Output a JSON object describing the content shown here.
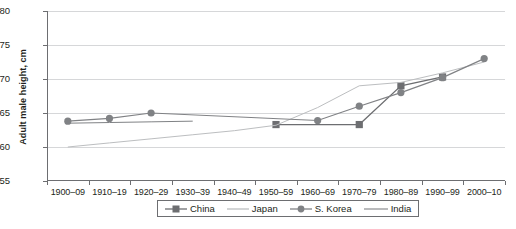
{
  "chart_data": {
    "type": "line",
    "title": "",
    "xlabel": "",
    "ylabel": "Adult male height, cm",
    "ylim": [
      155,
      180
    ],
    "yticks": [
      155,
      160,
      165,
      170,
      175,
      180
    ],
    "grid": true,
    "legend_position": "bottom",
    "categories": [
      "1900–09",
      "1910–19",
      "1920–29",
      "1930–39",
      "1940–49",
      "1950–59",
      "1960–69",
      "1970–79",
      "1980–89",
      "1990–99",
      "2000–10"
    ],
    "series": [
      {
        "name": "China",
        "color": "#6d6e71",
        "marker": "square",
        "values": [
          null,
          null,
          null,
          null,
          null,
          163.3,
          null,
          163.3,
          169.0,
          170.3,
          null
        ]
      },
      {
        "name": "Japan",
        "color": "#bcbec0",
        "marker": "none",
        "values": [
          160.0,
          160.6,
          161.2,
          161.8,
          162.4,
          163.2,
          165.8,
          169.0,
          169.5,
          170.9,
          172.5
        ]
      },
      {
        "name": "S. Korea",
        "color": "#808285",
        "marker": "circle",
        "values": [
          163.8,
          164.2,
          165.0,
          null,
          null,
          null,
          163.9,
          166.0,
          168.0,
          170.2,
          173.0
        ]
      },
      {
        "name": "India",
        "color": "#808285",
        "marker": "none",
        "values": [
          163.5,
          163.6,
          163.7,
          163.8,
          null,
          null,
          null,
          null,
          null,
          null,
          null
        ]
      }
    ]
  },
  "legend": {
    "items": [
      {
        "label": "China"
      },
      {
        "label": "Japan"
      },
      {
        "label": "S. Korea"
      },
      {
        "label": "India"
      }
    ]
  }
}
